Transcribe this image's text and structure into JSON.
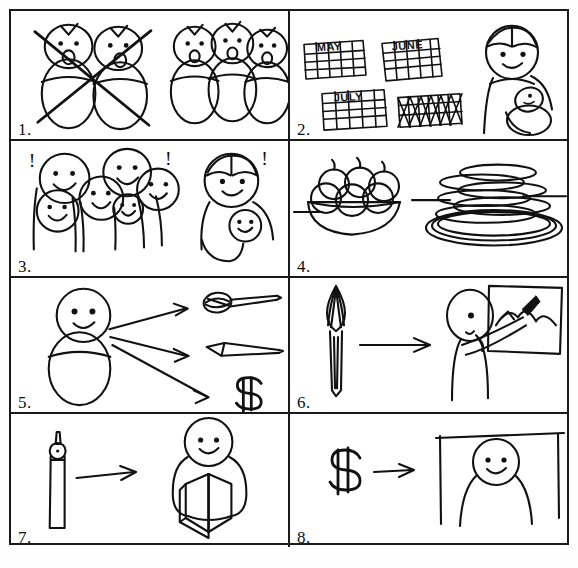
{
  "document": {
    "title": "Picture Sequence Worksheet",
    "panel_count": 8,
    "style": "hand-drawn black ink line art on white paper",
    "ink_color": "#111111",
    "paper_color": "#ffffff"
  },
  "panels": [
    {
      "number": "1.",
      "name": "panel-1",
      "description": "Two crossed-out singing figures on the left; three singing swaddled figures on the right",
      "left_scene": "two swaddled figures with open mouths, crossed out with a large X",
      "right_scene": "three swaddled figures with open mouths singing",
      "crossed_out": true,
      "figure_counts": {
        "left": 2,
        "right": 3
      }
    },
    {
      "number": "2.",
      "name": "panel-2",
      "description": "Four monthly calendars, last one crossed out, beside a person holding a baby",
      "calendars": [
        "MAY",
        "JUNE",
        "JULY",
        ""
      ],
      "crossed_calendar_index": 3,
      "right_scene": "woman holding a baby"
    },
    {
      "number": "3.",
      "name": "panel-3",
      "description": "Crowd of five smiling people with exclamation marks; a parent cradling a smiling baby",
      "crowd_faces": 5,
      "exclamations": [
        "!",
        "!",
        "!"
      ],
      "right_scene": "parent holding a smiling baby"
    },
    {
      "number": "4.",
      "name": "panel-4",
      "description": "A bowl of apples on a table beside a tall stack of plates",
      "left_object": "bowl of apples",
      "right_object": "stack of plates",
      "apple_count": 6,
      "plate_count": 7
    },
    {
      "number": "5.",
      "name": "panel-5",
      "description": "A baby with three arrows pointing to a paintbrush, a pen and a dollar sign",
      "source": "baby",
      "arrow_count": 3,
      "targets": [
        "paintbrush",
        "pen",
        "$"
      ]
    },
    {
      "number": "6.",
      "name": "panel-6",
      "description": "A paintbrush, an arrow, and a person painting a mountain landscape on a canvas",
      "left_object": "paintbrush",
      "arrow_count": 1,
      "right_scene": "person painting mountains on a canvas"
    },
    {
      "number": "7.",
      "name": "panel-7",
      "description": "A pen, an arrow, and a person holding an open book",
      "left_object": "pen",
      "arrow_count": 1,
      "right_scene": "person holding an open book"
    },
    {
      "number": "8.",
      "name": "panel-8",
      "description": "A dollar sign, an arrow, and a person standing under a doorway or building frame",
      "left_object": "$",
      "arrow_count": 1,
      "right_scene": "person standing beneath a building frame"
    }
  ]
}
